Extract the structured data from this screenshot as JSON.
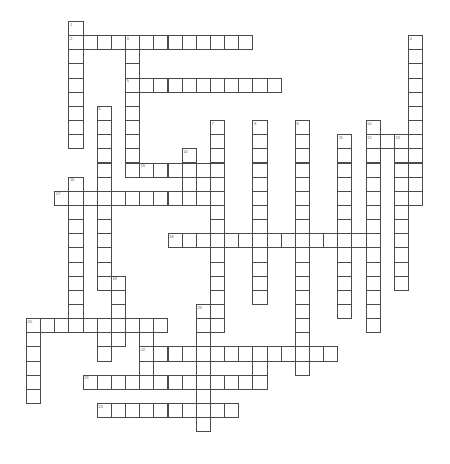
{
  "puzzle": {
    "title": "Crossword Puzzle Grid",
    "cell_size": 14.15,
    "origin_x": 26.0,
    "origin_y": 21.0,
    "colors": {
      "background": "#ffffff",
      "cell_fill": "#ffffff",
      "cell_border": "#4a4a4a",
      "number_color": "#6b6b6b"
    },
    "entries": [
      {
        "number": 1,
        "direction": "down",
        "col": 3,
        "row": 0,
        "length": 9,
        "answer": ""
      },
      {
        "number": 2,
        "direction": "across",
        "col": 3,
        "row": 1,
        "length": 13,
        "answer": ""
      },
      {
        "number": 3,
        "direction": "down",
        "col": 7,
        "row": 1,
        "length": 10,
        "answer": ""
      },
      {
        "number": 4,
        "direction": "down",
        "col": 27,
        "row": 1,
        "length": 12,
        "answer": ""
      },
      {
        "number": 5,
        "direction": "across",
        "col": 7,
        "row": 4,
        "length": 11,
        "answer": ""
      },
      {
        "number": 6,
        "direction": "down",
        "col": 5,
        "row": 6,
        "length": 13,
        "answer": ""
      },
      {
        "number": 7,
        "direction": "down",
        "col": 13,
        "row": 7,
        "length": 15,
        "answer": ""
      },
      {
        "number": 8,
        "direction": "down",
        "col": 16,
        "row": 7,
        "length": 13,
        "answer": ""
      },
      {
        "number": 9,
        "direction": "down",
        "col": 19,
        "row": 7,
        "length": 16,
        "answer": ""
      },
      {
        "number": 10,
        "direction": "down",
        "col": 24,
        "row": 7,
        "length": 15,
        "answer": ""
      },
      {
        "number": 11,
        "direction": "down",
        "col": 22,
        "row": 8,
        "length": 13,
        "answer": ""
      },
      {
        "number": 12,
        "direction": "across",
        "col": 24,
        "row": 8,
        "length": 4,
        "answer": ""
      },
      {
        "number": 13,
        "direction": "down",
        "col": 26,
        "row": 8,
        "length": 11,
        "answer": ""
      },
      {
        "number": 14,
        "direction": "down",
        "col": 11,
        "row": 9,
        "length": 3,
        "answer": ""
      },
      {
        "number": 15,
        "direction": "across",
        "col": 8,
        "row": 10,
        "length": 5,
        "answer": ""
      },
      {
        "number": 16,
        "direction": "down",
        "col": 3,
        "row": 11,
        "length": 11,
        "answer": ""
      },
      {
        "number": 17,
        "direction": "across",
        "col": 2,
        "row": 12,
        "length": 11,
        "answer": ""
      },
      {
        "number": 18,
        "direction": "across",
        "col": 10,
        "row": 15,
        "length": 14,
        "answer": ""
      },
      {
        "number": 19,
        "direction": "down",
        "col": 6,
        "row": 18,
        "length": 5,
        "answer": ""
      },
      {
        "number": 20,
        "direction": "across",
        "col": 0,
        "row": 21,
        "length": 10,
        "answer": ""
      },
      {
        "number": 21,
        "direction": "down",
        "col": 0,
        "row": 21,
        "length": 6,
        "answer": ""
      },
      {
        "number": 22,
        "direction": "across",
        "col": 8,
        "row": 23,
        "length": 14,
        "answer": ""
      },
      {
        "number": 23,
        "direction": "across",
        "col": 4,
        "row": 25,
        "length": 12,
        "answer": ""
      },
      {
        "number": 24,
        "direction": "across",
        "col": 5,
        "row": 27,
        "length": 10,
        "answer": ""
      },
      {
        "number": 25,
        "direction": "down",
        "col": 12,
        "row": 20,
        "length": 9,
        "answer": ""
      }
    ],
    "extra_cells": [
      {
        "col": 5,
        "row": 22
      },
      {
        "col": 5,
        "row": 23
      },
      {
        "col": 8,
        "row": 22
      },
      {
        "col": 8,
        "row": 24
      },
      {
        "col": 8,
        "row": 25
      },
      {
        "col": 19,
        "row": 22
      },
      {
        "col": 19,
        "row": 23
      },
      {
        "col": 19,
        "row": 24
      },
      {
        "col": 16,
        "row": 24
      },
      {
        "col": 16,
        "row": 25
      }
    ]
  }
}
